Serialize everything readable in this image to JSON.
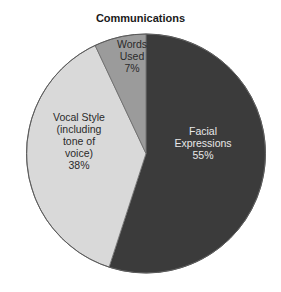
{
  "chart_data": {
    "type": "pie",
    "title": "Communications",
    "categories": [
      "Facial Expressions",
      "Vocal Style (including tone of voice)",
      "Words Used"
    ],
    "values": [
      55,
      38,
      7
    ],
    "unit": "%",
    "start_angle": "12 o'clock, clockwise",
    "series": [
      {
        "name": "Facial Expressions",
        "value": 55,
        "label_lines": [
          "Facial",
          "Expressions",
          "55%"
        ],
        "color": "#3b3b3b",
        "text_color": "#e8e8e8"
      },
      {
        "name": "Vocal Style (including tone of voice)",
        "value": 38,
        "label_lines": [
          "Vocal Style",
          "(including",
          "tone of",
          "voice)",
          "38%"
        ],
        "color": "#d9d9d9",
        "text_color": "#2a2a2a"
      },
      {
        "name": "Words Used",
        "value": 7,
        "label_lines": [
          "Words",
          "Used",
          "7%"
        ],
        "color": "#9b9b9b",
        "text_color": "#2a2a2a"
      }
    ],
    "legend": "none (labels inside slices)"
  },
  "title": "Communications"
}
